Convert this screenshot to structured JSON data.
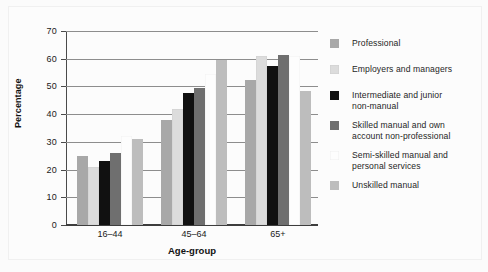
{
  "chart_data": {
    "type": "bar",
    "title": "",
    "xlabel": "Age-group",
    "ylabel": "Percentage",
    "categories": [
      "16–44",
      "45–64",
      "65+"
    ],
    "ylim": [
      0,
      70
    ],
    "yticks": [
      0,
      10,
      20,
      30,
      40,
      50,
      60,
      70
    ],
    "ytick_labels": [
      "0",
      "10",
      "20",
      "30",
      "40",
      "50",
      "60",
      "70"
    ],
    "grid": true,
    "legend_position": "right",
    "series": [
      {
        "name": "Professional",
        "color": "#a8a8a8",
        "values": [
          25,
          38,
          52.5
        ]
      },
      {
        "name": "Employers and managers",
        "color": "#dcdcdc",
        "values": [
          21,
          42,
          61
        ]
      },
      {
        "name": "Intermediate and junior non-manual",
        "color": "#111111",
        "values": [
          23,
          47.5,
          57.5
        ]
      },
      {
        "name": "Skilled manual and own account non-professional",
        "color": "#6f6f6f",
        "values": [
          26,
          49.5,
          61.5
        ]
      },
      {
        "name": "Semi-skilled manual and personal services",
        "color": "#fdfdfd",
        "values": [
          32,
          54.5,
          61
        ]
      },
      {
        "name": "Unskilled manual",
        "color": "#bdbdbd",
        "values": [
          31,
          59.5,
          48.5
        ]
      }
    ]
  },
  "legend": {
    "entries": [
      {
        "label": "Professional",
        "color": "#a8a8a8"
      },
      {
        "label": "Employers and managers",
        "color": "#dcdcdc"
      },
      {
        "label": "Intermediate and junior\nnon-manual",
        "color": "#111111"
      },
      {
        "label": "Skilled manual and own\naccount non-professional",
        "color": "#6f6f6f"
      },
      {
        "label": "Semi-skilled manual and\npersonal services",
        "color": "#fdfdfd"
      },
      {
        "label": "Unskilled manual",
        "color": "#bdbdbd"
      }
    ]
  },
  "axes": {
    "y_title": "Percentage",
    "x_title": "Age-group"
  }
}
